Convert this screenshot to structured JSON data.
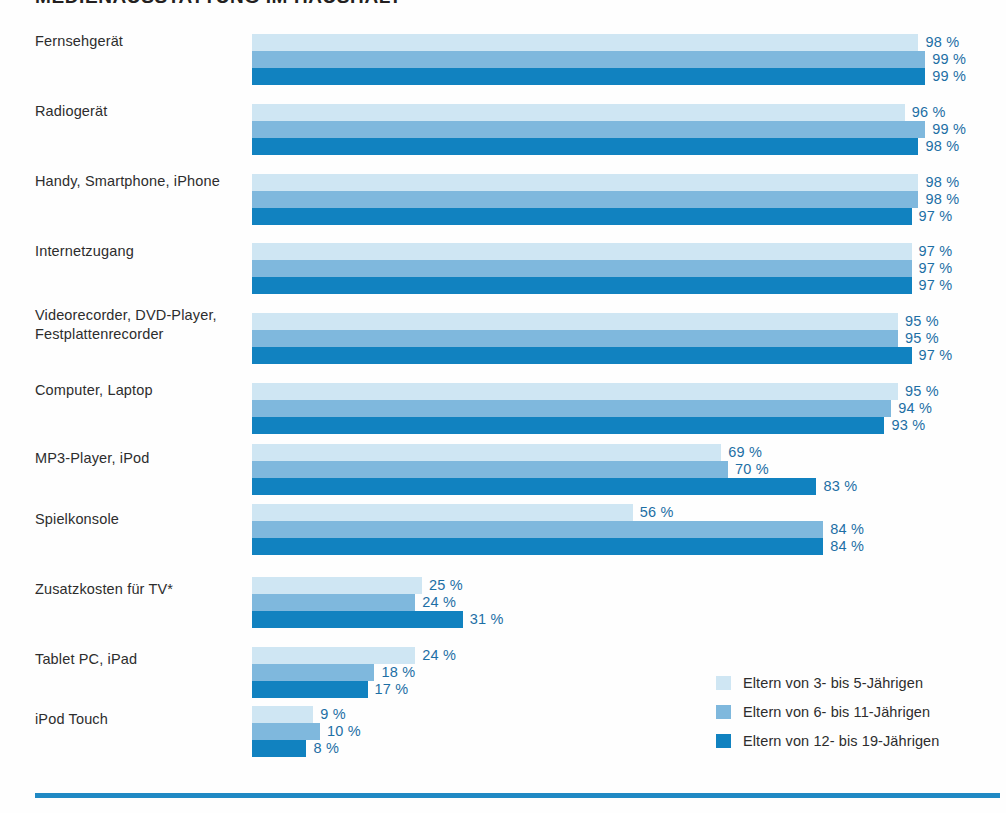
{
  "title": "MEDIENAUSSTATTUNG IM HAUSHALT",
  "colors": {
    "series_3_5": "#cfe6f3",
    "series_6_11": "#7fb8dd",
    "series_12_19": "#1182c0",
    "value_text": "#1d6fa5",
    "label_text": "#2d2d2d",
    "footer_rule": "#2089c4"
  },
  "legend": {
    "items": [
      {
        "label": "Eltern von 3- bis 5-Jährigen",
        "swatch": "s0"
      },
      {
        "label": "Eltern von 6- bis 11-Jährigen",
        "swatch": "s1"
      },
      {
        "label": "Eltern von 12- bis 19-Jährigen",
        "swatch": "s2"
      }
    ]
  },
  "footnote_marker": "*",
  "chart_data": {
    "type": "bar",
    "orientation": "horizontal",
    "title": "MEDIENAUSSTATTUNG IM HAUSHALT",
    "xlabel": "",
    "ylabel": "",
    "xlim": [
      0,
      100
    ],
    "grid": false,
    "legend_position": "bottom-right",
    "value_suffix": "%",
    "categories": [
      "Fernsehgerät",
      "Radiogerät",
      "Handy, Smartphone, iPhone",
      "Internetzugang",
      "Videorecorder, DVD-Player, Festplattenrecorder",
      "Computer, Laptop",
      "MP3-Player, iPod",
      "Spielkonsole",
      "Zusatzkosten für TV*",
      "Tablet PC, iPad",
      "iPod Touch"
    ],
    "series": [
      {
        "name": "Eltern von 3- bis 5-Jährigen",
        "color": "#cfe6f3",
        "values": [
          98,
          96,
          98,
          97,
          95,
          95,
          69,
          56,
          25,
          24,
          9
        ],
        "labels": [
          "98 %",
          "96 %",
          "98 %",
          "97 %",
          "95 %",
          "95 %",
          "69 %",
          "56 %",
          "25 %",
          "24 %",
          "9 %"
        ]
      },
      {
        "name": "Eltern von 6- bis 11-Jährigen",
        "color": "#7fb8dd",
        "values": [
          99,
          99,
          98,
          97,
          95,
          94,
          70,
          84,
          24,
          18,
          10
        ],
        "labels": [
          "99 %",
          "99 %",
          "98 %",
          "97 %",
          "95 %",
          "94 %",
          "70 %",
          "84 %",
          "24 %",
          "18 %",
          "10 %"
        ]
      },
      {
        "name": "Eltern von 12- bis 19-Jährigen",
        "color": "#1182c0",
        "values": [
          99,
          98,
          97,
          97,
          97,
          93,
          83,
          84,
          31,
          17,
          8
        ],
        "labels": [
          "99 %",
          "98 %",
          "97 %",
          "97 %",
          "97 %",
          "93 %",
          "83 %",
          "84 %",
          "31 %",
          "17 %",
          "8 %"
        ]
      }
    ]
  },
  "layout": {
    "row_tops": [
      34,
      104,
      174,
      243,
      313,
      383,
      444,
      504,
      577,
      647,
      706
    ],
    "label_tops": [
      32,
      102,
      172,
      242,
      306,
      381,
      449,
      510,
      580,
      650,
      710
    ],
    "px_per_percent": 6.8
  }
}
